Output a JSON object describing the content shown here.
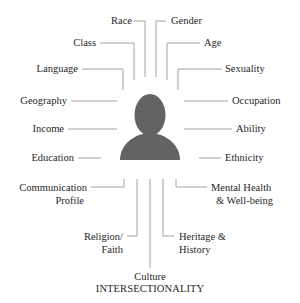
{
  "title": "INTERSECTIONALITY",
  "center_icon": "person-silhouette-icon",
  "colors": {
    "silhouette": "#636363",
    "lines": "#8a8a8a",
    "text": "#1f1f1f"
  },
  "labels": {
    "race": "Race",
    "gender": "Gender",
    "class": "Class",
    "age": "Age",
    "language": "Language",
    "sexuality": "Sexuality",
    "geography": "Geography",
    "occupation": "Occupation",
    "income": "Income",
    "ability": "Ability",
    "education": "Education",
    "ethnicity": "Ethnicity",
    "communication_1": "Communication",
    "communication_2": "Profile",
    "mental_health_1": "Mental Health",
    "mental_health_2": "& Well-being",
    "religion_1": "Religion/",
    "religion_2": "Faith",
    "heritage_1": "Heritage &",
    "heritage_2": "History",
    "culture": "Culture"
  }
}
